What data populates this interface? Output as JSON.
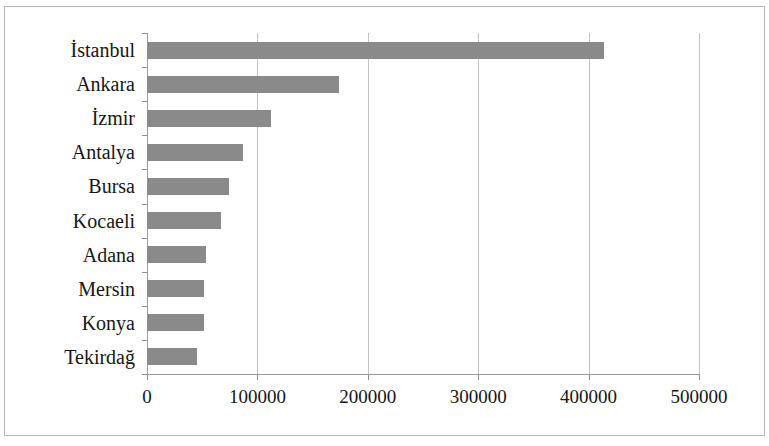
{
  "chart_data": {
    "type": "bar",
    "orientation": "horizontal",
    "title": "",
    "subtitle": "",
    "xlabel": "",
    "ylabel": "",
    "categories": [
      "İstanbul",
      "Ankara",
      "İzmir",
      "Antalya",
      "Bursa",
      "Kocaeli",
      "Adana",
      "Mersin",
      "Konya",
      "Tekirdağ"
    ],
    "values": [
      414000,
      174000,
      112000,
      87000,
      74000,
      67000,
      53000,
      52000,
      52000,
      45000
    ],
    "series": [
      {
        "name": "",
        "values": [
          414000,
          174000,
          112000,
          87000,
          74000,
          67000,
          53000,
          52000,
          52000,
          45000
        ]
      }
    ],
    "xlim": [
      0,
      500000
    ],
    "xticks": [
      0,
      100000,
      200000,
      300000,
      400000,
      500000
    ],
    "xtick_labels": [
      "0",
      "100000",
      "200000",
      "300000",
      "400000",
      "500000"
    ],
    "grid": "vertical",
    "legend": "none",
    "bar_color": "#8a8a8a",
    "gridline_color": "#c3c3c3",
    "axis_color": "#9a9a9a",
    "background_color": "#ffffff",
    "border_color": "#b9b9b9"
  }
}
